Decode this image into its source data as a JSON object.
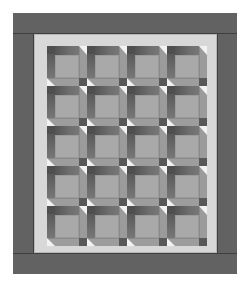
{
  "figure": {
    "rows": 5,
    "columns": 4,
    "colors": {
      "outer_border": "#626262",
      "inner_sashing": "#d8d8d8",
      "block_center": "#a9a9a9",
      "block_dark_bar": "#5a5a5a",
      "block_medium_strip": "#9b9b9b",
      "highlight_triangle": "#f2f2f2"
    }
  }
}
